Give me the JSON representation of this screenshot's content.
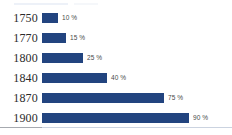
{
  "chart_data": {
    "type": "bar",
    "orientation": "horizontal",
    "title": "",
    "subtitle": "",
    "xlabel": "",
    "ylabel": "",
    "categories": [
      "1750",
      "1770",
      "1800",
      "1840",
      "1870",
      "1900"
    ],
    "values": [
      10,
      15,
      25,
      40,
      75,
      90
    ],
    "value_labels": [
      "10 %",
      "15 %",
      "25 %",
      "40 %",
      "75 %",
      "90 %"
    ],
    "unit": "%",
    "xlim": [
      0,
      100
    ],
    "grid": false,
    "legend": null,
    "series": [
      {
        "name": "",
        "values": [
          10,
          15,
          25,
          40,
          75,
          90
        ],
        "color": "#22447f"
      }
    ]
  },
  "style": {
    "bar_color": "#22447f",
    "background": "#ffffff",
    "category_text_color": "#2b2b2b",
    "value_text_color": "#4a4a4a",
    "rule_color": "#b9c4d6"
  }
}
